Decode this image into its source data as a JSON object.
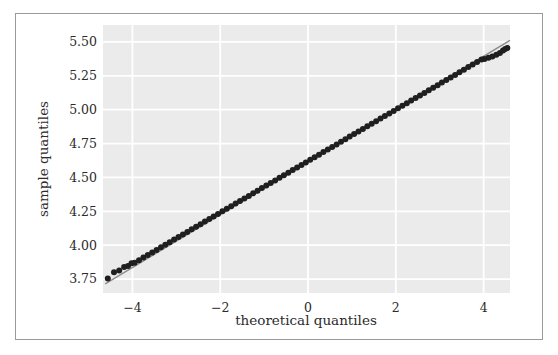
{
  "chart_data": {
    "type": "scatter",
    "variant": "qq-plot",
    "title": "",
    "xlabel": "theoretical quantiles",
    "ylabel": "sample quantiles",
    "xlim": [
      -4.67,
      4.6
    ],
    "ylim": [
      3.647,
      5.625
    ],
    "grid": true,
    "legend": null,
    "xticks": {
      "values": [
        -4,
        -2,
        0,
        2,
        4
      ],
      "labels": [
        "−4",
        "−2",
        "0",
        "2",
        "4"
      ]
    },
    "yticks": {
      "values": [
        3.75,
        4.0,
        4.25,
        4.5,
        4.75,
        5.0,
        5.25,
        5.5
      ],
      "labels": [
        "3.75",
        "4.00",
        "4.25",
        "4.50",
        "4.75",
        "5.00",
        "5.25",
        "5.50"
      ]
    },
    "reference_line": {
      "x": [
        -4.62,
        4.6
      ],
      "y": [
        3.714,
        5.512
      ],
      "color": "#8c8c8c"
    },
    "series": [
      {
        "name": "sample quantiles vs theoretical quantiles",
        "color": "#1f1f1f",
        "points": [
          [
            -4.56,
            3.754
          ],
          [
            -4.42,
            3.8
          ],
          [
            -4.3,
            3.813
          ],
          [
            -4.19,
            3.839
          ],
          [
            -4.1,
            3.846
          ],
          [
            -4.02,
            3.866
          ],
          [
            -3.95,
            3.87
          ],
          [
            -3.85,
            3.889
          ],
          [
            -3.75,
            3.908
          ],
          [
            -3.65,
            3.927
          ],
          [
            -3.55,
            3.946
          ],
          [
            -3.45,
            3.965
          ],
          [
            -3.35,
            3.984
          ],
          [
            -3.25,
            4.003
          ],
          [
            -3.15,
            4.022
          ],
          [
            -3.05,
            4.041
          ],
          [
            -2.95,
            4.06
          ],
          [
            -2.85,
            4.079
          ],
          [
            -2.75,
            4.098
          ],
          [
            -2.65,
            4.117
          ],
          [
            -2.55,
            4.136
          ],
          [
            -2.45,
            4.155
          ],
          [
            -2.35,
            4.174
          ],
          [
            -2.25,
            4.193
          ],
          [
            -2.15,
            4.212
          ],
          [
            -2.05,
            4.231
          ],
          [
            -1.95,
            4.25
          ],
          [
            -1.85,
            4.269
          ],
          [
            -1.75,
            4.288
          ],
          [
            -1.65,
            4.307
          ],
          [
            -1.55,
            4.326
          ],
          [
            -1.45,
            4.345
          ],
          [
            -1.35,
            4.364
          ],
          [
            -1.25,
            4.383
          ],
          [
            -1.15,
            4.402
          ],
          [
            -1.05,
            4.421
          ],
          [
            -0.95,
            4.44
          ],
          [
            -0.85,
            4.459
          ],
          [
            -0.75,
            4.478
          ],
          [
            -0.65,
            4.497
          ],
          [
            -0.55,
            4.516
          ],
          [
            -0.45,
            4.535
          ],
          [
            -0.35,
            4.554
          ],
          [
            -0.25,
            4.573
          ],
          [
            -0.15,
            4.592
          ],
          [
            -0.05,
            4.611
          ],
          [
            0.05,
            4.63
          ],
          [
            0.15,
            4.649
          ],
          [
            0.25,
            4.668
          ],
          [
            0.35,
            4.687
          ],
          [
            0.45,
            4.706
          ],
          [
            0.55,
            4.725
          ],
          [
            0.65,
            4.744
          ],
          [
            0.75,
            4.763
          ],
          [
            0.85,
            4.782
          ],
          [
            0.95,
            4.801
          ],
          [
            1.05,
            4.82
          ],
          [
            1.15,
            4.839
          ],
          [
            1.25,
            4.858
          ],
          [
            1.35,
            4.877
          ],
          [
            1.45,
            4.896
          ],
          [
            1.55,
            4.915
          ],
          [
            1.65,
            4.934
          ],
          [
            1.75,
            4.953
          ],
          [
            1.85,
            4.972
          ],
          [
            1.95,
            4.991
          ],
          [
            2.05,
            5.01
          ],
          [
            2.15,
            5.029
          ],
          [
            2.25,
            5.048
          ],
          [
            2.35,
            5.067
          ],
          [
            2.45,
            5.086
          ],
          [
            2.55,
            5.105
          ],
          [
            2.65,
            5.124
          ],
          [
            2.75,
            5.143
          ],
          [
            2.85,
            5.162
          ],
          [
            2.95,
            5.181
          ],
          [
            3.05,
            5.2
          ],
          [
            3.15,
            5.219
          ],
          [
            3.25,
            5.238
          ],
          [
            3.35,
            5.257
          ],
          [
            3.45,
            5.276
          ],
          [
            3.55,
            5.295
          ],
          [
            3.65,
            5.314
          ],
          [
            3.75,
            5.333
          ],
          [
            3.85,
            5.352
          ],
          [
            3.95,
            5.371
          ],
          [
            4.02,
            5.374
          ],
          [
            4.11,
            5.383
          ],
          [
            4.2,
            5.393
          ],
          [
            4.29,
            5.405
          ],
          [
            4.37,
            5.418
          ],
          [
            4.44,
            5.436
          ],
          [
            4.49,
            5.447
          ],
          [
            4.54,
            5.455
          ]
        ]
      }
    ],
    "colors": {
      "plot_background": "#ebebeb",
      "grid": "#ffffff",
      "tick_text": "#2b2b2b",
      "figure_border": "#9a9a9a",
      "point": "#1f1f1f",
      "reference_line": "#8c8c8c"
    }
  }
}
